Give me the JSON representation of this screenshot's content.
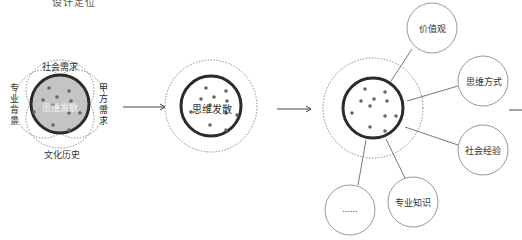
{
  "title": "设计定位",
  "colors": {
    "stroke": "#2b2b2b",
    "dotted": "#888888",
    "inner_fill": "#bdbdbd",
    "dot": "#666666",
    "satellite_stroke": "#9a9a9a",
    "text": "#333333"
  },
  "stage1": {
    "center_label": "思维发散",
    "factors": {
      "top": "社会需求",
      "bottom": "文化历史",
      "left": "专业背景",
      "right": "甲方需求"
    }
  },
  "stage2": {
    "center_label": "思维发散"
  },
  "stage3": {
    "satellites": [
      {
        "label": "价值观"
      },
      {
        "label": "思维方式"
      },
      {
        "label": "社会经验"
      },
      {
        "label": "专业知识"
      },
      {
        "label": "......"
      }
    ]
  }
}
